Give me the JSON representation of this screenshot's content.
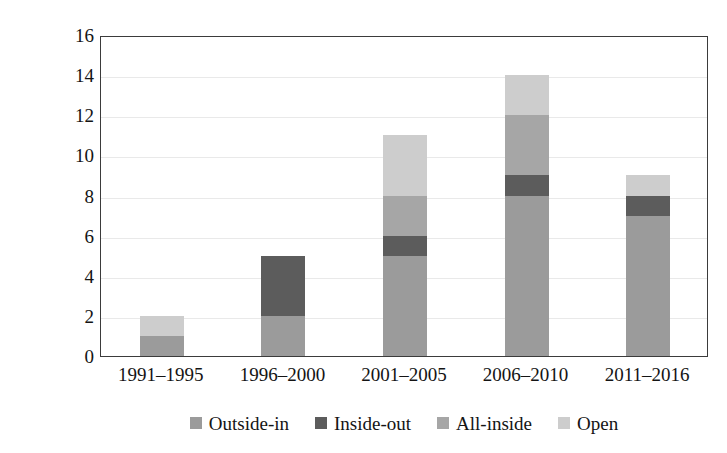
{
  "chart_data": {
    "type": "bar",
    "subtype": "stacked-bar",
    "title": "",
    "xlabel": "",
    "ylabel": "Number of papers",
    "categories": [
      "1991–1995",
      "1996–2000",
      "2001–2005",
      "2006–2010",
      "2011–2016"
    ],
    "series": [
      {
        "name": "Outside-in",
        "color": "#9b9b9b",
        "values": [
          1,
          2,
          5,
          8,
          7
        ]
      },
      {
        "name": "Inside-out",
        "color": "#5c5c5c",
        "values": [
          0,
          3,
          1,
          1,
          1
        ]
      },
      {
        "name": "All-inside",
        "color": "#a6a6a6",
        "values": [
          0,
          0,
          2,
          3,
          0
        ]
      },
      {
        "name": "Open",
        "color": "#cdcdcd",
        "values": [
          1,
          0,
          3,
          2,
          1
        ]
      }
    ],
    "totals": [
      2,
      5,
      11,
      14,
      9
    ],
    "ylim": [
      0,
      16
    ],
    "yticks": [
      0,
      2,
      4,
      6,
      8,
      10,
      12,
      14,
      16
    ],
    "ytick_labels": [
      "0",
      "2",
      "4",
      "6",
      "8",
      "10",
      "12",
      "14",
      "16"
    ],
    "grid": true,
    "grid_axis": "y",
    "legend_position": "bottom",
    "frame": true
  },
  "legend": {
    "items": [
      {
        "label": "Outside-in",
        "color": "#9b9b9b"
      },
      {
        "label": "Inside-out",
        "color": "#5c5c5c"
      },
      {
        "label": "All-inside",
        "color": "#a6a6a6"
      },
      {
        "label": "Open",
        "color": "#cdcdcd"
      }
    ]
  },
  "style": {
    "axis_color": "#3b3b3b",
    "grid_color": "#e9e9e9",
    "text_color": "#141414",
    "background": "#ffffff"
  }
}
